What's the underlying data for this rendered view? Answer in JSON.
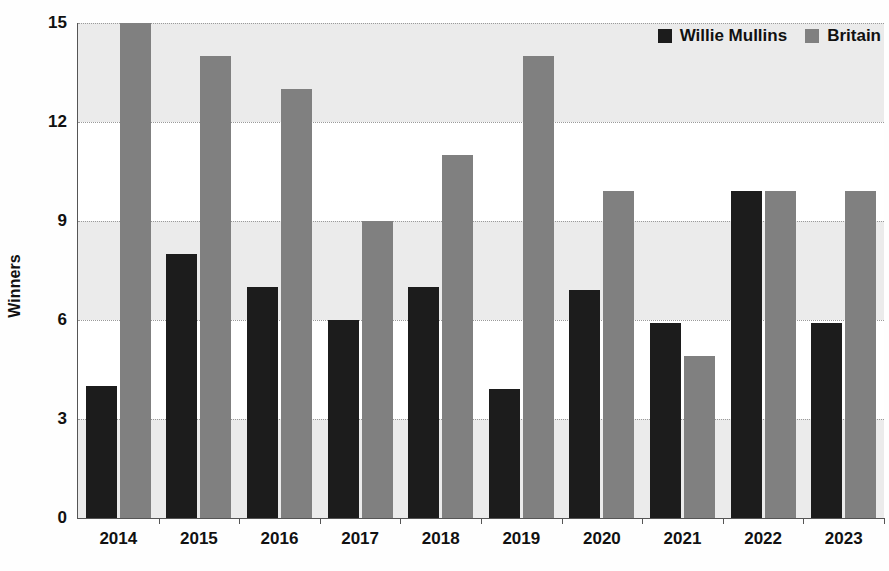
{
  "chart_data": {
    "type": "bar",
    "title": "",
    "subtitle": "",
    "xlabel": "",
    "ylabel": "Winners",
    "categories": [
      "2014",
      "2015",
      "2016",
      "2017",
      "2018",
      "2019",
      "2020",
      "2021",
      "2022",
      "2023"
    ],
    "series": [
      {
        "name": "Willie Mullins",
        "color": "#1c1c1c",
        "values": [
          4,
          8,
          7,
          6,
          7,
          3.9,
          6.9,
          5.9,
          9.9,
          5.9
        ]
      },
      {
        "name": "Britain",
        "color": "#808080",
        "values": [
          15,
          14,
          13,
          9,
          11,
          14,
          9.9,
          4.9,
          9.9,
          9.9
        ]
      }
    ],
    "ylim": [
      0,
      15
    ],
    "yticks": [
      0,
      3,
      6,
      9,
      12,
      15
    ],
    "ytick_labels": [
      "0",
      "3",
      "6",
      "9",
      "12",
      "15"
    ],
    "grid": true,
    "grid_style": "dotted-horizontal",
    "banding": true,
    "band_color": "#ebebeb",
    "legend_position": "top-right"
  },
  "legend": {
    "items": [
      {
        "label": "Willie Mullins",
        "color": "#1c1c1c"
      },
      {
        "label": "Britain",
        "color": "#808080"
      }
    ]
  },
  "axes": {
    "y_title": "Winners"
  }
}
